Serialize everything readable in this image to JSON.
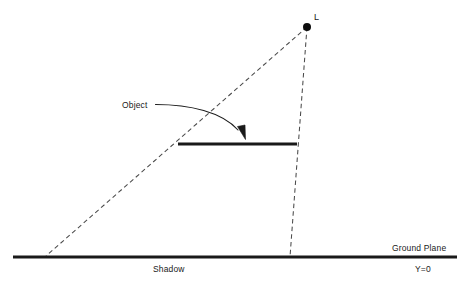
{
  "diagram": {
    "labels": {
      "light_source": "L",
      "object": "Object",
      "shadow": "Shadow",
      "ground_plane": "Ground Plane",
      "ground_equation": "Y=0"
    },
    "colors": {
      "stroke": "#1a1a1a",
      "dashed": "#4a4a4a",
      "background": "#ffffff"
    },
    "geometry": {
      "light_point": {
        "x": 307,
        "y": 27,
        "radius": 4
      },
      "object_bar": {
        "x1": 178,
        "y1": 144,
        "x2": 297,
        "y2": 144,
        "thickness": 3.2
      },
      "ground_line": {
        "x1": 13,
        "y1": 257,
        "x2": 457,
        "y2": 257,
        "thickness": 3.2
      },
      "ray_left": {
        "x1": 307,
        "y1": 27,
        "x2": 46,
        "y2": 256
      },
      "ray_right": {
        "x1": 307,
        "y1": 27,
        "x2": 290,
        "y2": 257
      },
      "leader_arrow": {
        "start_x": 155,
        "start_y": 105,
        "end_x": 244,
        "end_y": 137
      }
    },
    "label_positions": {
      "light_source": {
        "x": 314,
        "y": 20
      },
      "object": {
        "x": 122,
        "y": 108
      },
      "shadow": {
        "x": 153,
        "y": 272
      },
      "ground_plane": {
        "x": 392,
        "y": 251
      },
      "ground_equation": {
        "x": 415,
        "y": 272
      }
    }
  }
}
